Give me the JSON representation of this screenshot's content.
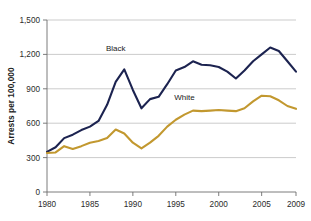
{
  "chart_data": {
    "type": "line",
    "title": "",
    "xlabel": "",
    "ylabel": "Arrests per 100,000",
    "xlim": [
      1980,
      2009
    ],
    "ylim": [
      0,
      1500
    ],
    "grid": true,
    "legend_position": "inline-annotations",
    "x": [
      1980,
      1981,
      1982,
      1983,
      1984,
      1985,
      1986,
      1987,
      1988,
      1989,
      1990,
      1991,
      1992,
      1993,
      1994,
      1995,
      1996,
      1997,
      1998,
      1999,
      2000,
      2001,
      2002,
      2003,
      2004,
      2005,
      2006,
      2007,
      2008,
      2009
    ],
    "xtick_labels": [
      "1980",
      "1985",
      "1990",
      "1995",
      "2000",
      "2005",
      "2009"
    ],
    "xticks": [
      1980,
      1985,
      1990,
      1995,
      2000,
      2005,
      2009
    ],
    "ytick_labels": [
      "0",
      "300",
      "600",
      "900",
      "1,200",
      "1,500"
    ],
    "yticks": [
      0,
      300,
      600,
      900,
      1200,
      1500
    ],
    "series": [
      {
        "name": "Black",
        "color": "#1c2350",
        "label_x": 1988,
        "label_y": 1230,
        "values": [
          350,
          390,
          470,
          500,
          540,
          570,
          620,
          760,
          960,
          1070,
          890,
          730,
          810,
          830,
          940,
          1060,
          1090,
          1140,
          1110,
          1105,
          1090,
          1050,
          990,
          1060,
          1140,
          1200,
          1260,
          1230,
          1140,
          1050
        ]
      },
      {
        "name": "White",
        "color": "#c2982f",
        "label_x": 1996,
        "label_y": 800,
        "values": [
          340,
          345,
          400,
          375,
          400,
          430,
          445,
          470,
          545,
          510,
          430,
          380,
          430,
          490,
          570,
          630,
          675,
          710,
          705,
          710,
          715,
          710,
          705,
          730,
          790,
          840,
          835,
          800,
          750,
          725
        ]
      }
    ]
  }
}
